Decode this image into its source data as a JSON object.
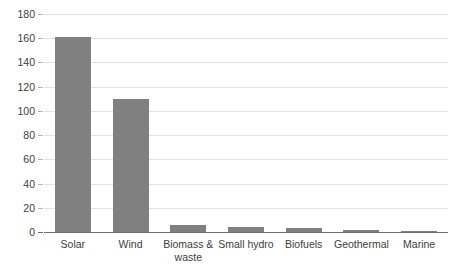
{
  "chart_data": {
    "type": "bar",
    "title": "",
    "subtitle": "",
    "xlabel": "",
    "ylabel": "",
    "categories": [
      "Solar",
      "Wind",
      "Biomass & waste",
      "Small hydro",
      "Biofuels",
      "Geothermal",
      "Marine"
    ],
    "values": [
      161,
      110,
      6,
      4,
      3,
      2,
      1
    ],
    "ylim": [
      0,
      180
    ],
    "ytick_step": 20,
    "yticks": [
      0,
      20,
      40,
      60,
      80,
      100,
      120,
      140,
      160,
      180
    ],
    "ytick_labels": [
      "0",
      "20",
      "40",
      "60",
      "80",
      "100",
      "120",
      "140",
      "160",
      "180"
    ],
    "grid": true,
    "grid_axis": "y",
    "legend": false,
    "legend_position": "none",
    "bar_color": "#808080",
    "gridline_color": "#e2e2e2",
    "axis_color": "#6e6e6e",
    "text_color": "#3d3d3d",
    "background_color": "#ffffff"
  }
}
